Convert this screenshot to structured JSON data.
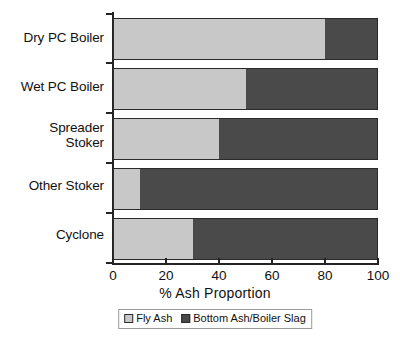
{
  "chart_data": {
    "type": "bar",
    "orientation": "horizontal",
    "stacked": true,
    "title": "",
    "xlabel": "% Ash  Proportion",
    "ylabel": "",
    "xlim": [
      0,
      100
    ],
    "xticks": [
      0,
      20,
      40,
      60,
      80,
      100
    ],
    "xtick_labels": [
      "0",
      "20",
      "40",
      "60",
      "80",
      "100"
    ],
    "grid": false,
    "legend_position": "bottom-center",
    "categories": [
      "Dry PC Boiler",
      "Wet PC Boiler",
      "Spreader\nStoker",
      "Other Stoker",
      "Cyclone"
    ],
    "category_labels": [
      {
        "line1": "Dry PC Boiler",
        "line2": ""
      },
      {
        "line1": "Wet PC Boiler",
        "line2": ""
      },
      {
        "line1": "Spreader",
        "line2": "Stoker"
      },
      {
        "line1": "Other Stoker",
        "line2": ""
      },
      {
        "line1": "Cyclone",
        "line2": ""
      }
    ],
    "series": [
      {
        "name": "Fly Ash",
        "color": "#c8c8c8",
        "values": [
          80,
          50,
          40,
          10,
          30
        ]
      },
      {
        "name": "Bottom Ash/Boiler Slag",
        "color": "#4a4a4a",
        "values": [
          20,
          50,
          60,
          90,
          70
        ]
      }
    ]
  },
  "legend": {
    "items": [
      {
        "label": "Fly Ash",
        "color": "#c8c8c8"
      },
      {
        "label": "Bottom Ash/Boiler Slag",
        "color": "#4a4a4a"
      }
    ]
  },
  "axis": {
    "x_title": "% Ash  Proportion"
  }
}
